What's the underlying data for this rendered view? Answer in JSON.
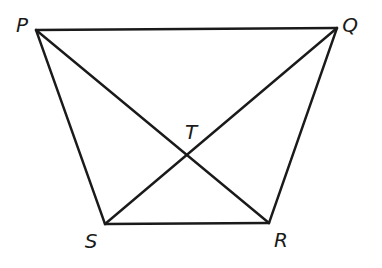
{
  "diagram": {
    "type": "trapezoid with diagonals",
    "vertices": [
      {
        "id": "P",
        "label": "P",
        "x": 36,
        "y": 30,
        "label_x": 22,
        "label_y": 25
      },
      {
        "id": "Q",
        "label": "Q",
        "x": 337,
        "y": 28,
        "label_x": 350,
        "label_y": 25
      },
      {
        "id": "R",
        "label": "R",
        "x": 269,
        "y": 223,
        "label_x": 281,
        "label_y": 240
      },
      {
        "id": "S",
        "label": "S",
        "x": 105,
        "y": 224,
        "label_x": 91,
        "label_y": 241
      },
      {
        "id": "T",
        "label": "T",
        "x": 186,
        "y": 155,
        "label_x": 191,
        "label_y": 132
      }
    ],
    "segments": [
      {
        "name": "PQ",
        "from": "P",
        "to": "Q"
      },
      {
        "name": "QR",
        "from": "Q",
        "to": "R"
      },
      {
        "name": "RS",
        "from": "R",
        "to": "S"
      },
      {
        "name": "SP",
        "from": "S",
        "to": "P"
      },
      {
        "name": "PR",
        "from": "P",
        "to": "R"
      },
      {
        "name": "QS",
        "from": "Q",
        "to": "S"
      }
    ],
    "colors": {
      "stroke": "#1a1a1a",
      "background": "#ffffff"
    }
  }
}
